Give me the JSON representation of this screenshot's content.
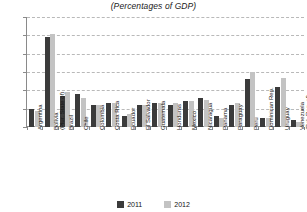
{
  "chart_data": {
    "type": "bar",
    "title": "(Percentages of GDP)",
    "xlabel": "",
    "ylabel": "",
    "ylim": [
      0,
      60
    ],
    "yticks": [
      0,
      10,
      20,
      30,
      40,
      50,
      60
    ],
    "grid": true,
    "legend_position": "bottom",
    "categories": [
      "Argentina",
      "Bolivia (Plur. State of)",
      "Brazil",
      "Chile",
      "Colombia",
      "Costa Rica",
      "Ecuador",
      "El Salvador",
      "Guatemala",
      "Honduras",
      "Mexico",
      "Nicaragua",
      "Panama",
      "Paraguay",
      "Peru",
      "Dominican Rep.",
      "Uruguay",
      "Venezuela (Bol. Rep. of)"
    ],
    "category_lines": [
      [
        "Argentina",
        ""
      ],
      [
        "Bolivia",
        "(Plur. State of)"
      ],
      [
        "Brazil",
        ""
      ],
      [
        "Chile",
        ""
      ],
      [
        "Colombia",
        ""
      ],
      [
        "Costa Rica",
        ""
      ],
      [
        "Ecuador",
        ""
      ],
      [
        "El Salvador",
        ""
      ],
      [
        "Guatemala",
        ""
      ],
      [
        "Honduras",
        ""
      ],
      [
        "Mexico",
        ""
      ],
      [
        "Nicaragua",
        ""
      ],
      [
        "Panama",
        ""
      ],
      [
        "Paraguay",
        ""
      ],
      [
        "Peru",
        ""
      ],
      [
        "Dominican Rep.",
        ""
      ],
      [
        "Uruguay",
        ""
      ],
      [
        "Venezuela",
        "(Bol. Rep. of)"
      ]
    ],
    "series": [
      {
        "name": "2011",
        "color": "#3b3b3b",
        "values": [
          10,
          49,
          17,
          18,
          12,
          13,
          6,
          12,
          13,
          12,
          14,
          16,
          6,
          12,
          26,
          5,
          22,
          4
        ]
      },
      {
        "name": "2012",
        "color": "#c3c3c3",
        "values": [
          9,
          51,
          19,
          16,
          12,
          13,
          7,
          12,
          13,
          13,
          14,
          15,
          5,
          13,
          30,
          5,
          27,
          3
        ]
      }
    ]
  },
  "legend": {
    "items": [
      {
        "label": "2011",
        "color": "#3b3b3b"
      },
      {
        "label": "2012",
        "color": "#c3c3c3"
      }
    ]
  }
}
